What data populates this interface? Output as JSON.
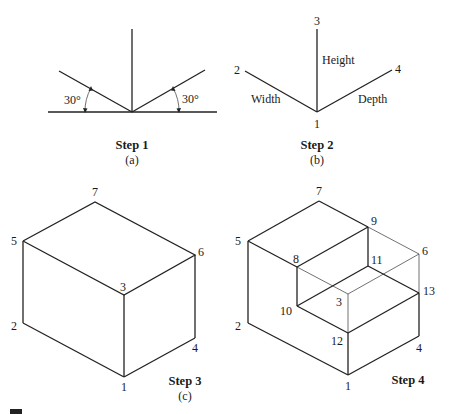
{
  "panels": {
    "a": {
      "step_label": "Step 1",
      "caption": "(a)",
      "angle_left": "30°",
      "angle_right": "30°"
    },
    "b": {
      "step_label": "Step 2",
      "caption": "(b)",
      "point_labels": {
        "p1": "1",
        "p2": "2",
        "p3": "3",
        "p4": "4"
      },
      "axis_labels": {
        "height": "Height",
        "width": "Width",
        "depth": "Depth"
      }
    },
    "c": {
      "step_label": "Step 3",
      "caption": "(c)",
      "point_labels": {
        "p1": "1",
        "p2": "2",
        "p3": "3",
        "p4": "4",
        "p5": "5",
        "p6": "6",
        "p7": "7"
      }
    },
    "d": {
      "step_label": "Step 4",
      "point_labels": {
        "p1": "1",
        "p2": "2",
        "p3": "3",
        "p4": "4",
        "p5": "5",
        "p6": "6",
        "p7": "7",
        "p8": "8",
        "p9": "9",
        "p10": "10",
        "p11": "11",
        "p12": "12",
        "p13": "13"
      }
    }
  },
  "colors": {
    "line": "#222222",
    "background": "#ffffff"
  }
}
